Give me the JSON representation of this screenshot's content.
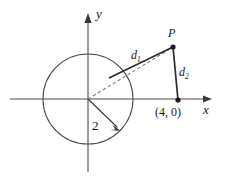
{
  "figure": {
    "background_color": "#ffffff",
    "stroke_color": "#3a3a3a",
    "label_color": "#1a1a1a"
  },
  "axes": {
    "x_axis_label": "x",
    "y_axis_label": "y",
    "x_axis": {
      "start_px": [
        10,
        99
      ],
      "end_px": [
        212,
        99
      ],
      "arrow": "right"
    },
    "y_axis": {
      "start_px": [
        88,
        172
      ],
      "end_px": [
        88,
        14
      ],
      "arrow": "up"
    }
  },
  "circle": {
    "center_px": [
      88,
      99
    ],
    "radius_px": 45,
    "radius_label": "2",
    "radius_arrow_from_px": [
      88,
      99
    ],
    "radius_arrow_to_px": [
      120,
      130
    ]
  },
  "points": [
    {
      "name": "P",
      "label": "P",
      "px": [
        173,
        47
      ],
      "style": "filled-dot"
    },
    {
      "name": "point-4-0",
      "label": "(4, 0)",
      "px": [
        178,
        100
      ],
      "style": "filled-dot"
    }
  ],
  "segments": [
    {
      "name": "d1",
      "label": "d",
      "subscript": "1",
      "from_px": [
        109,
        78
      ],
      "to_px": [
        173,
        47
      ],
      "style": "solid"
    },
    {
      "name": "d2",
      "label": "d",
      "subscript": "2",
      "from_px": [
        173,
        47
      ],
      "to_px": [
        178,
        100
      ],
      "style": "solid"
    },
    {
      "name": "ray-origin-to-P",
      "label": "",
      "from_px": [
        88,
        99
      ],
      "to_px": [
        173,
        47
      ],
      "style": "dashed"
    }
  ]
}
